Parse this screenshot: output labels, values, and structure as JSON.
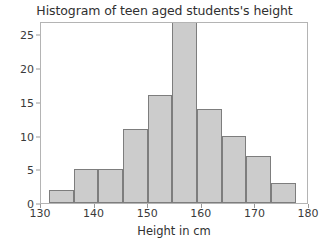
{
  "chart_data": {
    "type": "bar",
    "title": "Histogram of teen aged students's height",
    "xlabel": "Height in cm",
    "ylabel": "",
    "xlim": [
      130,
      180
    ],
    "ylim": [
      0,
      27
    ],
    "grid": false,
    "legend": "none",
    "bar_color": "#cccccc",
    "edge_color": "#7d7d7d",
    "xticks": [
      130,
      140,
      150,
      160,
      170,
      180
    ],
    "yticks": [
      0,
      5,
      10,
      15,
      20,
      25
    ],
    "bin_edges": [
      131.5,
      136.1,
      140.7,
      145.3,
      149.9,
      154.5,
      159.1,
      163.7,
      168.3,
      172.9,
      177.5
    ],
    "categories": [
      "131.5-136.1",
      "136.1-140.7",
      "140.7-145.3",
      "145.3-149.9",
      "149.9-154.5",
      "154.5-159.1",
      "159.1-163.7",
      "163.7-168.3",
      "168.3-172.9",
      "172.9-177.5"
    ],
    "values": [
      2,
      5,
      5,
      11,
      16,
      27,
      14,
      10,
      7,
      3
    ]
  },
  "axes": {
    "ytick_labels": [
      "0",
      "5",
      "10",
      "15",
      "20",
      "25"
    ],
    "xtick_labels": [
      "130",
      "140",
      "150",
      "160",
      "170",
      "180"
    ]
  }
}
